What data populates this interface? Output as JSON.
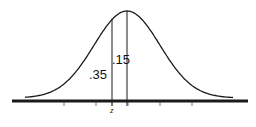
{
  "diagram": {
    "type": "normal-distribution",
    "labels": {
      "left_area": ".35",
      "center_area": ".15",
      "z_marker": "z"
    },
    "colors": {
      "line": "#1a1a1a",
      "background": "#ffffff"
    },
    "geometry": {
      "axis": {
        "x1": 12,
        "x2": 248,
        "y": 101,
        "thickness": 3
      },
      "curve": {
        "mean_x": 127,
        "sigma_px": 33,
        "baseline_y": 98,
        "peak_y": 11,
        "x_start": 25,
        "x_end": 233
      },
      "z_x": 112,
      "ticks_x": [
        64,
        96,
        112,
        128,
        160,
        192
      ]
    }
  }
}
